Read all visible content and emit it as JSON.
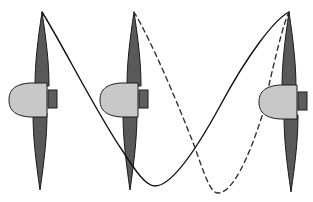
{
  "figure": {
    "canvas": {
      "width": 313,
      "height": 202,
      "background": "#ffffff"
    },
    "colors": {
      "blade_fill": "#595959",
      "blade_stroke": "#1a1a1a",
      "nacelle_fill": "#c8c8c8",
      "nacelle_stroke": "#1a1a1a",
      "hub_fill": "#5e5e5e",
      "hub_stroke": "#1a1a1a",
      "solid_curve": "#111111",
      "dashed_curve": "#333333",
      "background": "#ffffff"
    },
    "stroke_widths": {
      "blade": 1,
      "nacelle": 1,
      "hub": 1,
      "curve": 1.4
    }
  },
  "propellers": [
    {
      "id": "propeller-left",
      "label": "Left propeller station",
      "axis_x": 41,
      "hub_y": 99,
      "blade_upper": {
        "tip_x": 42,
        "tip_y": 12,
        "root_y": 86,
        "half_width": 7
      },
      "blade_lower": {
        "tip_x": 40,
        "tip_y": 190,
        "root_y": 113,
        "half_width": 7
      },
      "nacelle": {
        "nose_x": 9,
        "tail_x": 47,
        "top_y": 83,
        "bottom_y": 117
      },
      "hub": {
        "x": 48,
        "y": 90,
        "width": 9,
        "height": 18
      }
    },
    {
      "id": "propeller-middle",
      "label": "Middle propeller station",
      "axis_x": 132,
      "hub_y": 99,
      "blade_upper": {
        "tip_x": 134,
        "tip_y": 12,
        "root_y": 86,
        "half_width": 7
      },
      "blade_lower": {
        "tip_x": 130,
        "tip_y": 190,
        "root_y": 113,
        "half_width": 7
      },
      "nacelle": {
        "nose_x": 100,
        "tail_x": 138,
        "top_y": 83,
        "bottom_y": 117
      },
      "hub": {
        "x": 139,
        "y": 90,
        "width": 9,
        "height": 18
      }
    },
    {
      "id": "propeller-right",
      "label": "Right propeller station",
      "axis_x": 291,
      "hub_y": 101,
      "blade_upper": {
        "tip_x": 289,
        "tip_y": 12,
        "root_y": 88,
        "half_width": 7
      },
      "blade_lower": {
        "tip_x": 291,
        "tip_y": 192,
        "root_y": 115,
        "half_width": 7
      },
      "nacelle": {
        "nose_x": 259,
        "tail_x": 297,
        "top_y": 85,
        "bottom_y": 119
      },
      "hub": {
        "x": 298,
        "y": 92,
        "width": 9,
        "height": 18
      }
    }
  ],
  "curves": [
    {
      "id": "vortex-path-solid",
      "label": "Solid tip vortex trajectory",
      "style": "solid",
      "dash_pattern": "",
      "start": {
        "x": 42,
        "y": 12
      },
      "end": {
        "x": 289,
        "y": 12
      },
      "trough": {
        "x": 152,
        "y": 186
      },
      "path": "M 42 12 C 60 40 96 112 122 150 C 136 172 146 186 155 186 C 172 186 196 150 220 106 C 248 54 274 20 289 12"
    },
    {
      "id": "vortex-path-dashed",
      "label": "Dashed tip vortex trajectory",
      "style": "dashed",
      "dash_pattern": "5,4",
      "start": {
        "x": 134,
        "y": 12
      },
      "end": {
        "x": 289,
        "y": 12
      },
      "trough": {
        "x": 214,
        "y": 193
      },
      "path": "M 134 12 C 152 42 178 104 194 145 C 204 173 210 193 218 193 C 232 193 248 160 262 116 C 274 62 283 24 289 12"
    }
  ]
}
